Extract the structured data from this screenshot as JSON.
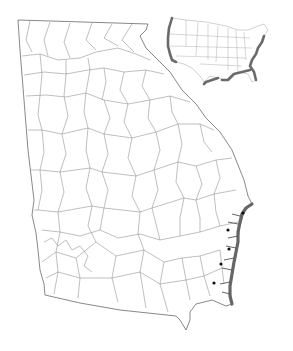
{
  "figure": {
    "main_map": {
      "subject": "Georgia county map",
      "feature": "county-boundaries",
      "highlighted_feature": "coastline",
      "highlight_color": "#666666",
      "boundary_color": "#8a8a8a"
    },
    "inset_map": {
      "subject": "contiguous United States",
      "highlighted_feature": "coastlines (Pacific, Gulf, Atlantic)",
      "highlight_color": "#5c5c5c"
    },
    "markers": {
      "count": 5,
      "color": "#111111",
      "points": [
        {
          "x": 243,
          "y": 213
        },
        {
          "x": 228,
          "y": 230
        },
        {
          "x": 229,
          "y": 249
        },
        {
          "x": 221,
          "y": 264
        },
        {
          "x": 214,
          "y": 283
        }
      ]
    }
  }
}
